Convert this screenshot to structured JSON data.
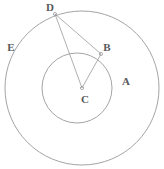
{
  "figure": {
    "width": 164,
    "height": 169,
    "background_color": "#ffffff",
    "stroke_color": "#9a9a9e",
    "label_color": "#58585a"
  },
  "chart_data": {
    "type": "diagram",
    "shapes": [
      {
        "name": "outer-circle",
        "kind": "circle",
        "cx": 82,
        "cy": 88,
        "r": 77,
        "stroke": "#9a9a9e",
        "fill": "none"
      },
      {
        "name": "inner-circle",
        "kind": "circle",
        "cx": 77,
        "cy": 88,
        "r": 35,
        "stroke": "#9a9a9e",
        "fill": "none"
      }
    ],
    "points": [
      {
        "id": "D",
        "x": 55,
        "y": 14,
        "label_x": 50,
        "label_y": 6,
        "on": "outer-circle"
      },
      {
        "id": "B",
        "x": 101,
        "y": 54,
        "label_x": 107,
        "label_y": 46,
        "on": "inner-circle"
      },
      {
        "id": "C",
        "x": 82,
        "y": 88,
        "label_x": 85,
        "label_y": 98,
        "on": "center"
      }
    ],
    "segments": [
      {
        "name": "segment-DB",
        "from": "D",
        "to": "B",
        "x1": 55,
        "y1": 14,
        "x2": 101,
        "y2": 54
      },
      {
        "name": "segment-DC",
        "from": "D",
        "to": "C",
        "x1": 55,
        "y1": 14,
        "x2": 82,
        "y2": 88
      },
      {
        "name": "segment-BC",
        "from": "B",
        "to": "C",
        "x1": 101,
        "y1": 54,
        "x2": 82,
        "y2": 88
      }
    ],
    "region_labels": [
      {
        "id": "E",
        "x": 11,
        "y": 48,
        "note": "outer circle region label"
      },
      {
        "id": "A",
        "x": 126,
        "y": 82,
        "note": "inner circle region label"
      }
    ]
  },
  "labels": {
    "A": "A",
    "B": "B",
    "C": "C",
    "D": "D",
    "E": "E"
  }
}
